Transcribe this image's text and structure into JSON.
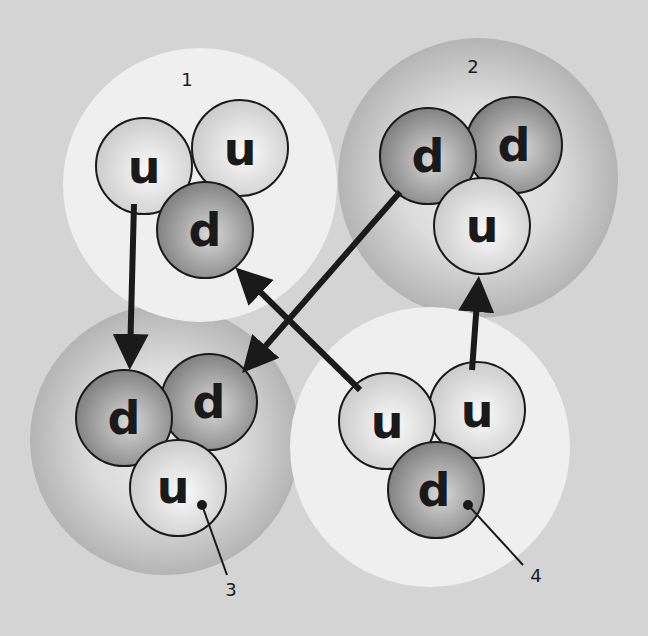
{
  "diagram": {
    "type": "quark-exchange",
    "colors": {
      "background": "#d4d4d4",
      "light_nucleon": "#efefef",
      "dark_nucleon_edge": "#b0b0b0",
      "up_quark": "#e2e2e2",
      "down_quark": "#8c8c8c",
      "ink": "#1a1a1a"
    },
    "nucleons": [
      {
        "id": "1",
        "label": "1",
        "style": "light",
        "quarks": [
          "u",
          "u",
          "d"
        ]
      },
      {
        "id": "2",
        "label": "2",
        "style": "dark",
        "quarks": [
          "d",
          "d",
          "u"
        ]
      },
      {
        "id": "3",
        "label": "3",
        "style": "dark",
        "quarks": [
          "d",
          "d",
          "u"
        ]
      },
      {
        "id": "4",
        "label": "4",
        "style": "light",
        "quarks": [
          "u",
          "u",
          "d"
        ]
      }
    ],
    "arrows": [
      {
        "from": "nucleon 1 u",
        "to": "nucleon 3 d"
      },
      {
        "from": "nucleon 2 d",
        "to": "nucleon 3 d"
      },
      {
        "from": "nucleon 4 u",
        "to": "nucleon 1 d"
      },
      {
        "from": "nucleon 4 u",
        "to": "nucleon 2 u"
      }
    ]
  }
}
